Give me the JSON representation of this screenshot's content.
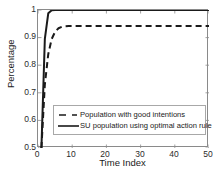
{
  "chart_data": {
    "type": "line",
    "title": "",
    "xlabel": "Time Index",
    "ylabel": "Percentage",
    "xlim": [
      0,
      50
    ],
    "ylim": [
      0.5,
      1
    ],
    "xticks": [
      "0",
      "10",
      "20",
      "30",
      "40",
      "50"
    ],
    "xtick_values": [
      0,
      10,
      20,
      30,
      40,
      50
    ],
    "yticks": [
      "0.5",
      "0.6",
      "0.7",
      "0.8",
      "0.9",
      "1"
    ],
    "ytick_values": [
      0.5,
      0.6,
      0.7,
      0.8,
      0.9,
      1
    ],
    "grid": false,
    "legend_position": "lower center",
    "x": [
      1,
      2,
      3,
      4,
      5,
      6,
      7,
      8,
      9,
      10,
      11,
      12,
      13,
      14,
      15,
      16,
      17,
      18,
      19,
      20,
      21,
      22,
      23,
      24,
      25,
      26,
      27,
      28,
      29,
      30,
      31,
      32,
      33,
      34,
      35,
      36,
      37,
      38,
      39,
      40,
      41,
      42,
      43,
      44,
      45,
      46,
      47,
      48,
      49,
      50
    ],
    "series": [
      {
        "name": "Population with good intentions",
        "style": "dashed",
        "color": "#1a1a1a",
        "values": [
          0.5,
          0.73,
          0.84,
          0.895,
          0.921,
          0.934,
          0.939,
          0.941,
          0.942,
          0.942,
          0.942,
          0.942,
          0.942,
          0.942,
          0.942,
          0.942,
          0.942,
          0.942,
          0.942,
          0.942,
          0.942,
          0.942,
          0.942,
          0.942,
          0.942,
          0.942,
          0.942,
          0.942,
          0.942,
          0.942,
          0.942,
          0.942,
          0.942,
          0.942,
          0.942,
          0.942,
          0.942,
          0.942,
          0.942,
          0.942,
          0.942,
          0.942,
          0.942,
          0.942,
          0.942,
          0.942,
          0.942,
          0.942,
          0.942,
          0.942
        ]
      },
      {
        "name": "SU population using optimal action rule",
        "style": "solid",
        "color": "#1a1a1a",
        "values": [
          0.5,
          0.895,
          0.988,
          0.999,
          1.0,
          1.0,
          1.0,
          1.0,
          1.0,
          1.0,
          1.0,
          1.0,
          1.0,
          1.0,
          1.0,
          1.0,
          1.0,
          1.0,
          1.0,
          1.0,
          1.0,
          1.0,
          1.0,
          1.0,
          1.0,
          1.0,
          1.0,
          1.0,
          1.0,
          1.0,
          1.0,
          1.0,
          1.0,
          1.0,
          1.0,
          1.0,
          1.0,
          1.0,
          1.0,
          1.0,
          1.0,
          1.0,
          1.0,
          1.0,
          1.0,
          1.0,
          1.0,
          1.0,
          1.0,
          1.0
        ]
      }
    ],
    "axis_color": "#8a8a8a"
  },
  "legend": {
    "items": [
      {
        "label": "Population with good intentions"
      },
      {
        "label": "SU population using optimal action rule"
      }
    ]
  }
}
